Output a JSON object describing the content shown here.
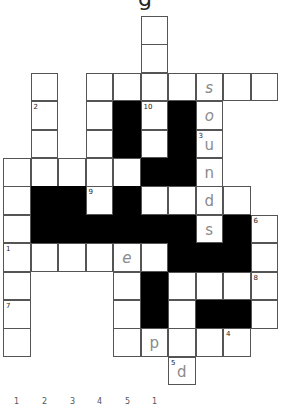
{
  "title_fragment": "g",
  "grid": {
    "origin_x": 3,
    "origin_y": 16,
    "cell_w": 27.5,
    "cell_h": 28.4,
    "cells": [
      {
        "r": 0,
        "c": 5
      },
      {
        "r": 1,
        "c": 5
      },
      {
        "r": 2,
        "c": 1
      },
      {
        "r": 2,
        "c": 3
      },
      {
        "r": 2,
        "c": 4
      },
      {
        "r": 2,
        "c": 5
      },
      {
        "r": 2,
        "c": 6
      },
      {
        "r": 2,
        "c": 7,
        "letter": "s",
        "italic": true
      },
      {
        "r": 2,
        "c": 8
      },
      {
        "r": 2,
        "c": 9
      },
      {
        "r": 3,
        "c": 1,
        "num": "2"
      },
      {
        "r": 3,
        "c": 3
      },
      {
        "r": 3,
        "c": 4,
        "black": true
      },
      {
        "r": 3,
        "c": 5,
        "num": "10"
      },
      {
        "r": 3,
        "c": 6,
        "black": true
      },
      {
        "r": 3,
        "c": 7,
        "letter": "o",
        "italic": true
      },
      {
        "r": 4,
        "c": 1
      },
      {
        "r": 4,
        "c": 3
      },
      {
        "r": 4,
        "c": 4,
        "black": true
      },
      {
        "r": 4,
        "c": 5
      },
      {
        "r": 4,
        "c": 6,
        "black": true
      },
      {
        "r": 4,
        "c": 7,
        "num": "3",
        "letter": "u"
      },
      {
        "r": 5,
        "c": 0
      },
      {
        "r": 5,
        "c": 1
      },
      {
        "r": 5,
        "c": 2
      },
      {
        "r": 5,
        "c": 3
      },
      {
        "r": 5,
        "c": 4
      },
      {
        "r": 5,
        "c": 5,
        "black": true
      },
      {
        "r": 5,
        "c": 6,
        "black": true
      },
      {
        "r": 5,
        "c": 7,
        "letter": "n"
      },
      {
        "r": 6,
        "c": 0
      },
      {
        "r": 6,
        "c": 1,
        "black": true
      },
      {
        "r": 6,
        "c": 2,
        "black": true
      },
      {
        "r": 6,
        "c": 3,
        "num": "9"
      },
      {
        "r": 6,
        "c": 4,
        "black": true
      },
      {
        "r": 6,
        "c": 5
      },
      {
        "r": 6,
        "c": 6
      },
      {
        "r": 6,
        "c": 7,
        "letter": "d"
      },
      {
        "r": 6,
        "c": 8
      },
      {
        "r": 7,
        "c": 0
      },
      {
        "r": 7,
        "c": 1,
        "black": true
      },
      {
        "r": 7,
        "c": 2,
        "black": true
      },
      {
        "r": 7,
        "c": 3,
        "black": true
      },
      {
        "r": 7,
        "c": 4,
        "black": true
      },
      {
        "r": 7,
        "c": 5,
        "black": true
      },
      {
        "r": 7,
        "c": 6,
        "black": true
      },
      {
        "r": 7,
        "c": 7,
        "letter": "s"
      },
      {
        "r": 7,
        "c": 8,
        "black": true
      },
      {
        "r": 7,
        "c": 9,
        "num": "6"
      },
      {
        "r": 8,
        "c": 0,
        "num": "1"
      },
      {
        "r": 8,
        "c": 1
      },
      {
        "r": 8,
        "c": 2
      },
      {
        "r": 8,
        "c": 3
      },
      {
        "r": 8,
        "c": 4,
        "letter": "e",
        "italic": true
      },
      {
        "r": 8,
        "c": 5
      },
      {
        "r": 8,
        "c": 6,
        "black": true
      },
      {
        "r": 8,
        "c": 7,
        "black": true
      },
      {
        "r": 8,
        "c": 8,
        "black": true
      },
      {
        "r": 8,
        "c": 9
      },
      {
        "r": 9,
        "c": 0
      },
      {
        "r": 9,
        "c": 4
      },
      {
        "r": 9,
        "c": 5,
        "black": true
      },
      {
        "r": 9,
        "c": 6
      },
      {
        "r": 9,
        "c": 7
      },
      {
        "r": 9,
        "c": 8
      },
      {
        "r": 9,
        "c": 9,
        "num": "8"
      },
      {
        "r": 10,
        "c": 0,
        "num": "7"
      },
      {
        "r": 10,
        "c": 4
      },
      {
        "r": 10,
        "c": 5,
        "black": true
      },
      {
        "r": 10,
        "c": 6
      },
      {
        "r": 10,
        "c": 7,
        "black": true
      },
      {
        "r": 10,
        "c": 8,
        "black": true
      },
      {
        "r": 10,
        "c": 9
      },
      {
        "r": 11,
        "c": 0
      },
      {
        "r": 11,
        "c": 4
      },
      {
        "r": 11,
        "c": 5,
        "letter": "p"
      },
      {
        "r": 11,
        "c": 6
      },
      {
        "r": 11,
        "c": 7
      },
      {
        "r": 11,
        "c": 8,
        "num": "4"
      },
      {
        "r": 12,
        "c": 6,
        "num": "5",
        "letter": "d"
      }
    ]
  },
  "bottom_numbers": [
    {
      "label": "1",
      "x": 14
    },
    {
      "label": "2",
      "x": 42
    },
    {
      "label": "3",
      "x": 70
    },
    {
      "label": "4",
      "x": 97
    },
    {
      "label": "5",
      "x": 125
    },
    {
      "label": "1",
      "x": 152
    }
  ],
  "colors": {
    "letter": "#8a8a8a",
    "border": "#555555",
    "black_cell": "#000000"
  }
}
